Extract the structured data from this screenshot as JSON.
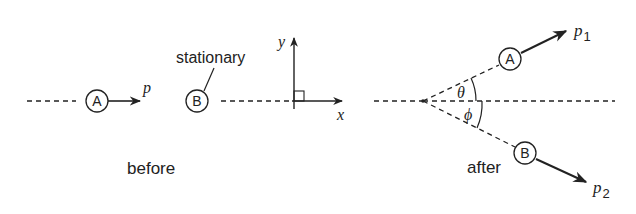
{
  "before": {
    "caption": "before",
    "ball_a": "A",
    "ball_b": "B",
    "momentum_label": "p",
    "stationary_label": "stationary",
    "axis_x": "x",
    "axis_y": "y"
  },
  "after": {
    "caption": "after",
    "ball_a": "A",
    "ball_b": "B",
    "p1_label": "p",
    "p1_sub": "1",
    "p2_label": "p",
    "p2_sub": "2",
    "theta": "θ",
    "phi": "ϕ"
  },
  "colors": {
    "stroke": "#222222",
    "text": "#333333"
  }
}
